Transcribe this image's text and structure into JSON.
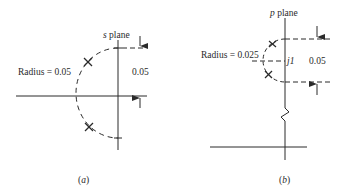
{
  "panels": {
    "a": {
      "plane_label_var": "s",
      "plane_label_word": " plane",
      "radius_label": "Radius = 0.05",
      "dimension_label": "0.05",
      "caption_open": "(",
      "caption_var": "a",
      "caption_close": ")",
      "poles": 2
    },
    "b": {
      "plane_label_var": "p",
      "plane_label_word": " plane",
      "radius_label": "Radius = 0.025",
      "axis_point_label": "j1",
      "dimension_label": "0.05",
      "caption_open": "(",
      "caption_var": "b",
      "caption_close": ")",
      "poles": 2
    }
  },
  "colors": {
    "ink": "#2a2a2a",
    "background": "#ffffff"
  }
}
